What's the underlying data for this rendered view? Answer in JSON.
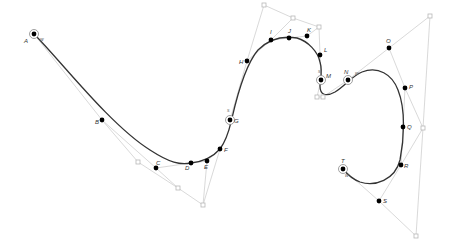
{
  "diagram": {
    "type": "bezier-spline-construction",
    "colors": {
      "curve": "#333333",
      "control_polygon": "#cfcfcf",
      "on_curve_point": "#000000",
      "control_point": "#b8b8b8",
      "label": "#333333"
    },
    "curve_path": "M34,34 C60,60 110,125 150,150 C170,163 180,165 191,163 C200,162 212,158 220,149 C228,138 230,126 232,118 C238,92 246,64 258,50 C270,38 285,36 297,38 C308,41 318,52 320,62 C323,72 320,80 320,86 C320,95 326,97 335,92 C345,86 352,76 362,72 C378,66 392,74 398,90 C406,110 404,140 400,160 C395,180 375,187 360,182 C352,179 347,174 343,169",
    "control_polygons": [
      [
        [
          34,
          34
        ],
        [
          102,
          120
        ],
        [
          138,
          162
        ],
        [
          178,
          188
        ],
        [
          203,
          205
        ],
        [
          220,
          149
        ]
      ],
      [
        [
          102,
          120
        ],
        [
          156,
          168
        ],
        [
          178,
          188
        ]
      ],
      [
        [
          156,
          168
        ],
        [
          191,
          163
        ],
        [
          207,
          161
        ],
        [
          220,
          149
        ]
      ],
      [
        [
          207,
          161
        ],
        [
          203,
          205
        ]
      ],
      [
        [
          230,
          120
        ],
        [
          247,
          61
        ],
        [
          264,
          5
        ],
        [
          293,
          18
        ],
        [
          319,
          27
        ],
        [
          320,
          55
        ],
        [
          321,
          80
        ]
      ],
      [
        [
          247,
          61
        ],
        [
          271,
          40
        ],
        [
          293,
          18
        ]
      ],
      [
        [
          271,
          40
        ],
        [
          289,
          38
        ],
        [
          307,
          36
        ],
        [
          319,
          27
        ]
      ],
      [
        [
          321,
          80
        ],
        [
          317,
          97
        ],
        [
          323,
          97
        ],
        [
          348,
          80
        ],
        [
          389,
          48
        ],
        [
          430,
          16
        ],
        [
          423,
          128
        ],
        [
          416,
          236
        ],
        [
          379,
          201
        ],
        [
          343,
          169
        ]
      ],
      [
        [
          389,
          48
        ],
        [
          405,
          88
        ],
        [
          423,
          128
        ]
      ],
      [
        [
          405,
          88
        ],
        [
          403,
          127
        ],
        [
          401,
          165
        ],
        [
          379,
          201
        ]
      ],
      [
        [
          401,
          165
        ],
        [
          423,
          128
        ]
      ]
    ],
    "points": [
      {
        "label": "A",
        "x": 34,
        "y": 34,
        "circled": true,
        "lx": 24,
        "ly": 43
      },
      {
        "label": "B",
        "x": 102,
        "y": 120,
        "circled": false,
        "lx": 95,
        "ly": 124
      },
      {
        "label": "C",
        "x": 156,
        "y": 168,
        "circled": false,
        "lx": 156,
        "ly": 165
      },
      {
        "label": "D",
        "x": 191,
        "y": 163,
        "circled": false,
        "lx": 185,
        "ly": 170
      },
      {
        "label": "E",
        "x": 207,
        "y": 161,
        "circled": false,
        "lx": 204,
        "ly": 169
      },
      {
        "label": "F",
        "x": 220,
        "y": 149,
        "circled": false,
        "lx": 224,
        "ly": 152
      },
      {
        "label": "G",
        "x": 230,
        "y": 120,
        "circled": true,
        "lx": 234,
        "ly": 123
      },
      {
        "label": "H",
        "x": 247,
        "y": 61,
        "circled": false,
        "lx": 239,
        "ly": 64
      },
      {
        "label": "I",
        "x": 271,
        "y": 40,
        "circled": false,
        "lx": 270,
        "ly": 34
      },
      {
        "label": "J",
        "x": 289,
        "y": 38,
        "circled": false,
        "lx": 288,
        "ly": 33
      },
      {
        "label": "K",
        "x": 307,
        "y": 36,
        "circled": false,
        "lx": 307,
        "ly": 32
      },
      {
        "label": "L",
        "x": 320,
        "y": 55,
        "circled": false,
        "lx": 324,
        "ly": 52
      },
      {
        "label": "M",
        "x": 321,
        "y": 80,
        "circled": true,
        "lx": 326,
        "ly": 78
      },
      {
        "label": "N",
        "x": 348,
        "y": 80,
        "circled": true,
        "lx": 344,
        "ly": 74
      },
      {
        "label": "O",
        "x": 389,
        "y": 48,
        "circled": false,
        "lx": 386,
        "ly": 43
      },
      {
        "label": "P",
        "x": 405,
        "y": 88,
        "circled": false,
        "lx": 409,
        "ly": 89
      },
      {
        "label": "Q",
        "x": 403,
        "y": 127,
        "circled": false,
        "lx": 407,
        "ly": 129
      },
      {
        "label": "R",
        "x": 401,
        "y": 165,
        "circled": false,
        "lx": 404,
        "ly": 168
      },
      {
        "label": "S",
        "x": 379,
        "y": 201,
        "circled": false,
        "lx": 383,
        "ly": 203
      },
      {
        "label": "T",
        "x": 343,
        "y": 169,
        "circled": true,
        "lx": 341,
        "ly": 163
      }
    ],
    "control_points": [
      {
        "x": 138,
        "y": 162
      },
      {
        "x": 178,
        "y": 188
      },
      {
        "x": 203,
        "y": 205
      },
      {
        "x": 264,
        "y": 5
      },
      {
        "x": 293,
        "y": 18
      },
      {
        "x": 319,
        "y": 27
      },
      {
        "x": 317,
        "y": 97
      },
      {
        "x": 323,
        "y": 97
      },
      {
        "x": 430,
        "y": 16
      },
      {
        "x": 423,
        "y": 128
      },
      {
        "x": 416,
        "y": 236
      }
    ],
    "tangent_marks": [
      {
        "text": "w",
        "x": 40,
        "y": 41
      },
      {
        "text": "s",
        "x": 227,
        "y": 112
      },
      {
        "text": "s",
        "x": 318,
        "y": 73
      },
      {
        "text": "w",
        "x": 355,
        "y": 75
      },
      {
        "text": "w",
        "x": 345,
        "y": 177
      }
    ]
  }
}
